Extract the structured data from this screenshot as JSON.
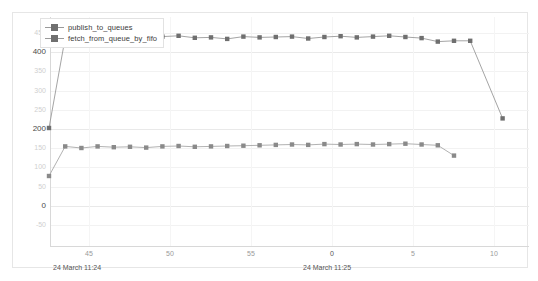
{
  "chart_data": {
    "type": "line",
    "title": "",
    "xlabel": "",
    "ylabel": "",
    "ylim": [
      -50,
      450
    ],
    "y_ticks": [
      450,
      400,
      350,
      300,
      250,
      200,
      150,
      100,
      50,
      0,
      -50
    ],
    "y_major_ticks": [
      400,
      200,
      0
    ],
    "grid": true,
    "legend_position": "top-left",
    "x_tick_labels": [
      "45",
      "50",
      "55",
      "0",
      "5",
      "10"
    ],
    "x_time_labels": [
      "24 March 11:24",
      "24 March 11:25"
    ],
    "x": [
      43,
      44,
      45,
      46,
      47,
      48,
      49,
      50,
      51,
      52,
      53,
      54,
      55,
      56,
      57,
      58,
      59,
      0,
      1,
      2,
      3,
      4,
      5,
      6,
      7,
      8,
      9,
      10,
      11
    ],
    "series": [
      {
        "name": "publish_to_queues",
        "color": "#6f6f6f",
        "line_color": "#9a9a9a",
        "values": [
          200,
          435,
          434,
          438,
          436,
          437,
          433,
          438,
          440,
          435,
          436,
          432,
          438,
          436,
          437,
          438,
          433,
          437,
          439,
          436,
          438,
          440,
          437,
          434,
          425,
          427,
          427,
          null,
          225
        ]
      },
      {
        "name": "fetch_from_queue_by_fifo",
        "color": "#8a8a8a",
        "line_color": "#a8a8a8",
        "values": [
          75,
          152,
          148,
          152,
          150,
          151,
          149,
          152,
          153,
          151,
          152,
          153,
          154,
          155,
          156,
          157,
          156,
          158,
          157,
          158,
          157,
          158,
          159,
          157,
          155,
          128,
          null,
          null,
          null
        ]
      }
    ]
  },
  "legend": {
    "items": [
      {
        "label": "publish_to_queues"
      },
      {
        "label": "fetch_from_queue_by_fifo"
      }
    ]
  },
  "axis": {
    "y_labels": [
      "450",
      "400",
      "350",
      "300",
      "250",
      "200",
      "150",
      "100",
      "50",
      "0",
      "-50"
    ],
    "x_labels": [
      "45",
      "50",
      "55",
      "0",
      "5",
      "10"
    ],
    "time_left": "24 March 11:24",
    "time_right": "24 March 11:25"
  },
  "colors": {
    "series_1": "#6f6f6f",
    "series_2": "#8a8a8a",
    "grid": "#f2f2f2",
    "axis": "#d8d8d8",
    "frame": "#e6e6e6",
    "label_muted": "#cfcfcf",
    "label_major": "#4a4a4a"
  }
}
